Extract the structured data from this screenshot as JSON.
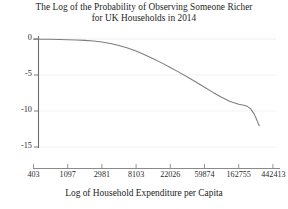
{
  "chart_data": {
    "type": "line",
    "title": "The Log of the Probability of Observing Someone Richer for UK Households in 2014",
    "title_lines": [
      "The Log of the Probability of Observing Someone Richer",
      "for UK Households in 2014"
    ],
    "xlabel": "Log of Household Expenditure per Capita",
    "ylabel": "",
    "x_tick_labels": [
      "403",
      "1097",
      "2981",
      "8103",
      "22026",
      "59874",
      "162755",
      "442413"
    ],
    "x_tick_values": [
      6,
      7,
      8,
      9,
      10,
      11,
      12,
      13
    ],
    "y_tick_labels": [
      "0",
      "-5",
      "-10",
      "-15"
    ],
    "y_tick_values": [
      0,
      -5,
      -10,
      -15
    ],
    "xlim": [
      6,
      13
    ],
    "ylim": [
      -15,
      0
    ],
    "grid": "horizontal",
    "legend": "none",
    "line_color": "#7a7a7a",
    "series": [
      {
        "name": "log P(richer)",
        "x": [
          6.0,
          6.25,
          6.5,
          6.75,
          7.0,
          7.25,
          7.5,
          7.75,
          8.0,
          8.25,
          8.5,
          8.75,
          9.0,
          9.25,
          9.5,
          9.75,
          10.0,
          10.25,
          10.5,
          10.75,
          11.0,
          11.25,
          11.5,
          11.75,
          12.0,
          12.15,
          12.25,
          12.35,
          12.45,
          12.5,
          12.55,
          12.6
        ],
        "y": [
          -0.02,
          -0.03,
          -0.04,
          -0.06,
          -0.09,
          -0.13,
          -0.19,
          -0.28,
          -0.42,
          -0.62,
          -0.9,
          -1.25,
          -1.68,
          -2.18,
          -2.73,
          -3.32,
          -3.95,
          -4.6,
          -5.28,
          -5.98,
          -6.7,
          -7.42,
          -8.1,
          -8.68,
          -9.05,
          -9.2,
          -9.35,
          -9.7,
          -10.4,
          -10.9,
          -11.5,
          -12.05
        ]
      }
    ]
  }
}
